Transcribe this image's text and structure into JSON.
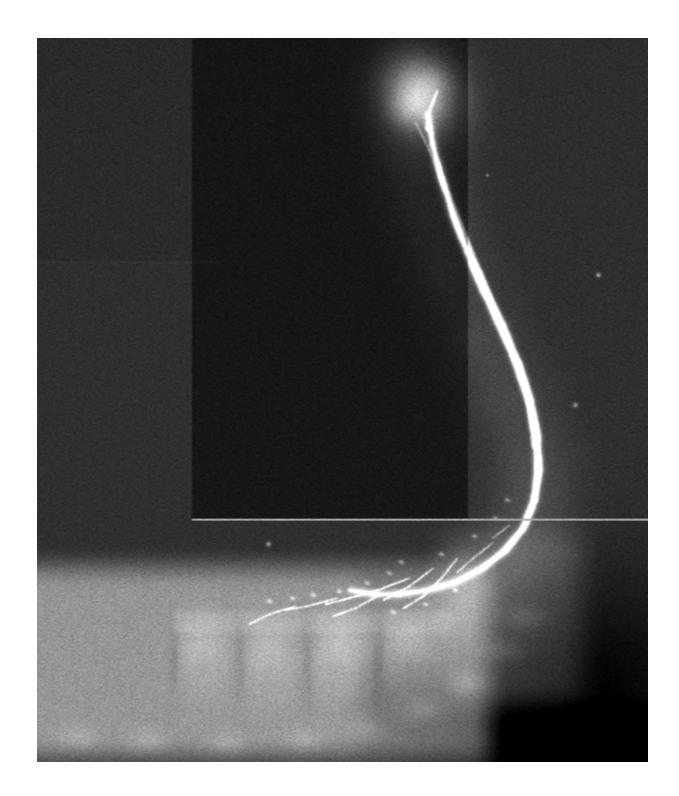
{
  "page": {
    "background_color": "#ffffff",
    "width": 679,
    "height": 796,
    "caption": ""
  },
  "film": {
    "label": "sialogram-radiograph",
    "modality": "radiograph",
    "colorspace": "grayscale",
    "x": 37,
    "y": 38,
    "width": 611,
    "height": 724,
    "base_color": "#2e2e2e",
    "border_color": "#ffffff"
  },
  "anatomy": {
    "structures": [
      {
        "name": "parotid-gland-opacified",
        "description": "Bright contrast-filled glandular mass, upper right of field",
        "cx": 420,
        "cy": 95,
        "rx": 46,
        "ry": 52,
        "intensity": "#f2f0ea"
      },
      {
        "name": "parotid-duct-stensen",
        "description": "Long bright opacified duct curving inferiorly then anteriorly",
        "intensity": "#fbfaf6"
      },
      {
        "name": "mandibular-ramus-posterior-border",
        "description": "Soft grey band paralleling the bright duct",
        "intensity": "#8a8a86"
      },
      {
        "name": "mandibular-body",
        "description": "Broad light band across the lower third of the film",
        "intensity": "#b9b8b2"
      },
      {
        "name": "mandibular-teeth",
        "description": "Row of molar / premolar crowns and roots in the mandibular body",
        "count": 4,
        "intensity": "#cfcec8"
      },
      {
        "name": "duct-branches",
        "description": "Fine bright branching ductules over the tooth-bearing region",
        "intensity": "#fefdf9"
      }
    ]
  },
  "overlays": {
    "collimation_mask": {
      "name": "collimation-mask-rectangle",
      "description": "Darker rectangular sub-field in the left/central upper area",
      "x": 192,
      "y": 38,
      "width": 276,
      "height": 481,
      "tone": "#1d1d1d"
    },
    "horizontal_scan_line": {
      "name": "bright-horizontal-line",
      "description": "Thin bright horizontal artefact line across the film",
      "y": 519,
      "thickness": 2,
      "tone": "#cdcdc8"
    },
    "faint_horizontal_seam": {
      "name": "faint-horizontal-seam",
      "description": "Very faint horizontal tonal seam on the left side",
      "y": 262,
      "tone": "#3a3a3a"
    },
    "film_grain": {
      "name": "film-grain-noise",
      "amount": 0.22,
      "description": "Heavy analog film grain across the whole plate"
    },
    "dust_specks": [
      {
        "x": 598,
        "y": 275,
        "r": 2
      },
      {
        "x": 575,
        "y": 405,
        "r": 2
      },
      {
        "x": 487,
        "y": 175,
        "r": 1
      },
      {
        "x": 268,
        "y": 544,
        "r": 2
      }
    ]
  },
  "chart_data": {
    "type": "heatmap",
    "title": "",
    "xlabel": "",
    "ylabel": ""
  }
}
